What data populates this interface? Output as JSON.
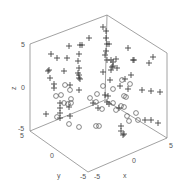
{
  "chart_data": {
    "type": "scatter3d",
    "title": "",
    "xlabel": "x",
    "ylabel": "y",
    "zlabel": "z",
    "xlim": [
      -5,
      5
    ],
    "ylim": [
      -5,
      5
    ],
    "zlim": [
      -5,
      5
    ],
    "x_ticks": [
      "-5",
      "0",
      "5"
    ],
    "y_ticks": [
      "5",
      "0",
      "-5"
    ],
    "z_ticks": [
      "5",
      "0",
      "-5"
    ],
    "grid": false,
    "legend": null,
    "series": [
      {
        "name": "plus markers",
        "marker": "+",
        "points_px": [
          [
            89,
            38
          ],
          [
            80,
            45
          ],
          [
            82,
            45
          ],
          [
            69,
            46
          ],
          [
            51,
            54
          ],
          [
            57,
            58
          ],
          [
            67,
            58
          ],
          [
            79,
            54
          ],
          [
            78,
            61
          ],
          [
            79,
            68
          ],
          [
            48,
            71
          ],
          [
            49,
            70
          ],
          [
            64,
            71
          ],
          [
            78,
            73
          ],
          [
            79,
            75
          ],
          [
            79,
            78
          ],
          [
            80,
            79
          ],
          [
            50,
            78
          ],
          [
            54,
            84
          ],
          [
            54,
            88
          ],
          [
            70,
            85
          ],
          [
            79,
            90
          ],
          [
            103,
            27
          ],
          [
            106,
            31
          ],
          [
            106,
            38
          ],
          [
            107,
            44
          ],
          [
            109,
            44
          ],
          [
            106,
            51
          ],
          [
            105,
            55
          ],
          [
            107,
            60
          ],
          [
            111,
            60
          ],
          [
            113,
            62
          ],
          [
            116,
            59
          ],
          [
            113,
            66
          ],
          [
            117,
            68
          ],
          [
            111,
            70
          ],
          [
            103,
            72
          ],
          [
            112,
            67
          ],
          [
            128,
            48
          ],
          [
            133,
            60
          ],
          [
            134,
            60
          ],
          [
            153,
            57
          ],
          [
            149,
            63
          ],
          [
            131,
            75
          ],
          [
            125,
            79
          ],
          [
            120,
            86
          ],
          [
            110,
            80
          ],
          [
            128,
            89
          ],
          [
            142,
            90
          ],
          [
            151,
            91
          ],
          [
            160,
            92
          ],
          [
            107,
            102
          ],
          [
            98,
            108
          ],
          [
            109,
            104
          ],
          [
            119,
            108
          ],
          [
            145,
            120
          ],
          [
            151,
            120
          ],
          [
            158,
            123
          ],
          [
            121,
            126
          ],
          [
            121,
            131
          ],
          [
            123,
            135
          ],
          [
            124,
            134
          ],
          [
            46,
            114
          ],
          [
            60,
            118
          ],
          [
            60,
            113
          ],
          [
            60,
            108
          ],
          [
            60,
            103
          ],
          [
            69,
            107
          ],
          [
            70,
            116
          ],
          [
            105,
            95
          ],
          [
            93,
            103
          ],
          [
            108,
            96
          ]
        ]
      },
      {
        "name": "circle markers",
        "marker": "o",
        "points_px": [
          [
            122,
            80
          ],
          [
            130,
            84
          ],
          [
            124,
            96
          ],
          [
            126,
            97
          ],
          [
            97,
            94
          ],
          [
            103,
            86
          ],
          [
            113,
            89
          ],
          [
            113,
            103
          ],
          [
            102,
            109
          ],
          [
            116,
            110
          ],
          [
            124,
            107
          ],
          [
            121,
            106
          ],
          [
            136,
            113
          ],
          [
            138,
            120
          ],
          [
            61,
            95
          ],
          [
            64,
            103
          ],
          [
            68,
            104
          ],
          [
            71,
            103
          ],
          [
            70,
            90
          ],
          [
            65,
            85
          ],
          [
            56,
            96
          ],
          [
            71,
            99
          ],
          [
            57,
            117
          ],
          [
            69,
            124
          ],
          [
            79,
            127
          ],
          [
            96,
            126
          ],
          [
            99,
            126
          ],
          [
            96,
            102
          ],
          [
            90,
            98
          ],
          [
            127,
            116
          ],
          [
            129,
            121
          ]
        ]
      }
    ]
  }
}
